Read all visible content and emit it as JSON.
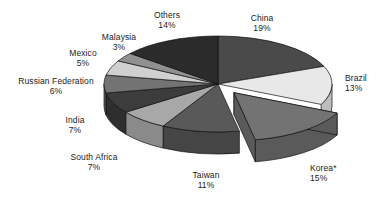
{
  "chart_data": {
    "type": "pie",
    "title": "",
    "subtitle": "",
    "xlabel": "",
    "ylabel": "",
    "legend_position": "none",
    "grid": false,
    "exploded_slices": [
      "Korea*"
    ],
    "start_angle_deg": 0,
    "direction": "clockwise",
    "three_d": true,
    "categories": [
      "China",
      "Brazil",
      "Korea*",
      "Taiwan",
      "South Africa",
      "India",
      "Russian Federation",
      "Mexico",
      "Malaysia",
      "Others"
    ],
    "values": [
      19,
      13,
      15,
      11,
      7,
      7,
      6,
      5,
      3,
      14
    ],
    "value_suffix": "%",
    "slices": [
      {
        "label": "China",
        "value": 19,
        "value_text": "19%",
        "color": "#4a4a4a",
        "side_color": "#3a3a3a",
        "exploded": false
      },
      {
        "label": "Brazil",
        "value": 13,
        "value_text": "13%",
        "color": "#e8e8e8",
        "side_color": "#bdbdbd",
        "exploded": false
      },
      {
        "label": "Korea*",
        "value": 15,
        "value_text": "15%",
        "color": "#737373",
        "side_color": "#5a5a5a",
        "exploded": true
      },
      {
        "label": "Taiwan",
        "value": 11,
        "value_text": "11%",
        "color": "#595959",
        "side_color": "#454545",
        "exploded": false
      },
      {
        "label": "South Africa",
        "value": 7,
        "value_text": "7%",
        "color": "#a8a8a8",
        "side_color": "#8a8a8a",
        "exploded": false
      },
      {
        "label": "India",
        "value": 7,
        "value_text": "7%",
        "color": "#3c3c3c",
        "side_color": "#2e2e2e",
        "exploded": false
      },
      {
        "label": "Russian Federation",
        "value": 6,
        "value_text": "6%",
        "color": "#737373",
        "side_color": "#5a5a5a",
        "exploded": false
      },
      {
        "label": "Mexico",
        "value": 5,
        "value_text": "5%",
        "color": "#d0d0d0",
        "side_color": "#ababab",
        "exploded": false
      },
      {
        "label": "Malaysia",
        "value": 3,
        "value_text": "3%",
        "color": "#909090",
        "side_color": "#737373",
        "exploded": false
      },
      {
        "label": "Others",
        "value": 14,
        "value_text": "14%",
        "color": "#2b2b2b",
        "side_color": "#202020",
        "exploded": false
      }
    ]
  },
  "labels": {
    "china": {
      "name": "China",
      "value": "19%"
    },
    "brazil": {
      "name": "Brazil",
      "value": "13%"
    },
    "korea": {
      "name": "Korea*",
      "value": "15%"
    },
    "taiwan": {
      "name": "Taiwan",
      "value": "11%"
    },
    "south_africa": {
      "name": "South Africa",
      "value": "7%"
    },
    "india": {
      "name": "India",
      "value": "7%"
    },
    "russian_federation": {
      "name": "Russian Federation",
      "value": "6%"
    },
    "mexico": {
      "name": "Mexico",
      "value": "5%"
    },
    "malaysia": {
      "name": "Malaysia",
      "value": "3%"
    },
    "others": {
      "name": "Others",
      "value": "14%"
    }
  }
}
